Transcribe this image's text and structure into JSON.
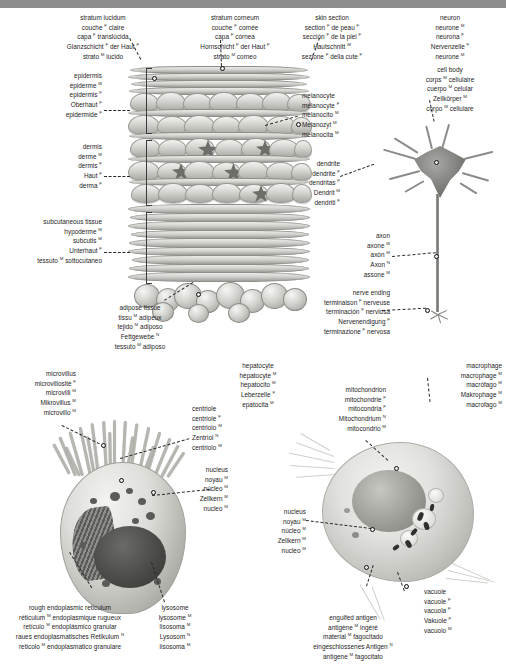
{
  "page": {
    "languages": [
      "English",
      "French",
      "Spanish",
      "German",
      "Italian"
    ],
    "gender_marks": {
      "masculine": "M",
      "feminine": "F",
      "neuter": "N"
    }
  },
  "panels": {
    "skin": {
      "heading_left": {
        "en": "stratum lucidum",
        "fr": "couche",
        "fr_g": "F",
        "fr_rest": "claire",
        "es": "capa",
        "es_g": "F",
        "es_rest": "translúcida",
        "de": "Glanzschicht",
        "de_g": "F",
        "de_rest": "der Haut",
        "de_rest_g": "F",
        "it": "strato",
        "it_g": "M",
        "it_rest": "lucido"
      },
      "heading_mid": {
        "en": "stratum corneum",
        "fr": "couche",
        "fr_g": "F",
        "fr_rest": "cornée",
        "es": "capa",
        "es_g": "F",
        "es_rest": "córnea",
        "de": "Hornschicht",
        "de_g": "F",
        "de_rest": "der Haut",
        "de_rest_g": "F",
        "it": "strato",
        "it_g": "M",
        "it_rest": "corneo"
      },
      "heading_right": {
        "en": "skin section",
        "fr": "section",
        "fr_g": "F",
        "fr_rest": "de peau",
        "fr_rest_g": "F",
        "es": "sección",
        "es_g": "F",
        "es_rest": "de la piel",
        "es_rest_g": "F",
        "de": "Hautschnitt",
        "de_g": "M",
        "it": "sezione",
        "it_g": "F",
        "it_rest": "della cute",
        "it_rest_g": "F"
      },
      "epidermis": {
        "en": "epidermis",
        "fr": "épiderme",
        "fr_g": "M",
        "es": "epidermis",
        "es_g": "F",
        "de": "Oberhaut",
        "de_g": "F",
        "it": "epidermide",
        "it_g": "F"
      },
      "dermis": {
        "en": "dermis",
        "fr": "derme",
        "fr_g": "M",
        "es": "dermis",
        "es_g": "F",
        "de": "Haut",
        "de_g": "F",
        "it": "derma",
        "it_g": "F"
      },
      "subcutaneous": {
        "en": "subcutaneous tissue",
        "fr": "hypoderme",
        "fr_g": "M",
        "es": "subcutis",
        "es_g": "M",
        "de": "Unterhaut",
        "de_g": "F",
        "it": "tessuto",
        "it_g": "M",
        "it_rest": "sottocutaneo"
      },
      "adipose": {
        "en": "adipose tissue",
        "fr": "tissu",
        "fr_g": "M",
        "fr_rest": "adipeux",
        "es": "tejido",
        "es_g": "M",
        "es_rest": "adiposo",
        "de": "Fettgewebe",
        "de_g": "N",
        "it": "tessuto",
        "it_g": "M",
        "it_rest": "adiposo"
      },
      "melanocyte": {
        "en": "melanocyte",
        "fr": "mélanocyte",
        "fr_g": "F",
        "es": "melanocito",
        "es_g": "M",
        "de": "Melanozyt",
        "de_g": "M",
        "it": "melanocita",
        "it_g": "M"
      }
    },
    "neuron": {
      "heading": {
        "en": "neuron",
        "fr": "neurone",
        "fr_g": "M",
        "es": "neurona",
        "es_g": "F",
        "de": "Nervenzelle",
        "de_g": "F",
        "it": "neurone",
        "it_g": "M"
      },
      "cell_body": {
        "en": "cell body",
        "fr": "corps",
        "fr_g": "M",
        "fr_rest": "cellulaire",
        "es": "cuerpo",
        "es_g": "M",
        "es_rest": "celular",
        "de": "Zellkörper",
        "de_g": "M",
        "it": "corpo",
        "it_g": "M",
        "it_rest": "cellulare"
      },
      "dendrite": {
        "en": "dendrite",
        "fr": "dendrite",
        "fr_g": "F",
        "es": "dendritas",
        "es_g": "F",
        "de": "Dendrit",
        "de_g": "M",
        "it": "dendriti",
        "it_g": "F"
      },
      "axon": {
        "en": "axon",
        "fr": "axone",
        "fr_g": "M",
        "es": "axón",
        "es_g": "M",
        "de": "Axon",
        "de_g": "N",
        "it": "assone",
        "it_g": "M"
      },
      "nerve_ending": {
        "en": "nerve ending",
        "fr": "terminaison",
        "fr_g": "F",
        "fr_rest": "nerveuse",
        "es": "terminación",
        "es_g": "F",
        "es_rest": "nerviosa",
        "de": "Nervenendigung",
        "de_g": "F",
        "it": "terminazione",
        "it_g": "F",
        "it_rest": "nervosa"
      }
    },
    "hepatocyte": {
      "heading": {
        "en": "hepatocyte",
        "fr": "hépatocyte",
        "fr_g": "M",
        "es": "hepatocito",
        "es_g": "M",
        "de": "Leberzelle",
        "de_g": "F",
        "it": "epatocita",
        "it_g": "M"
      },
      "microvillus": {
        "en": "microvillus",
        "fr": "microvillosité",
        "fr_g": "F",
        "es": "microvilli",
        "es_g": "M",
        "de": "Mikrovillus",
        "de_g": "M",
        "it": "microvillo",
        "it_g": "M"
      },
      "centriole": {
        "en": "centriole",
        "fr": "centriole",
        "fr_g": "F",
        "es": "centriolo",
        "es_g": "M",
        "de": "Zentriol",
        "de_g": "N",
        "it": "centriolo",
        "it_g": "M"
      },
      "nucleus": {
        "en": "nucleus",
        "fr": "noyau",
        "fr_g": "M",
        "es": "núcleo",
        "es_g": "M",
        "de": "Zellkern",
        "de_g": "M",
        "it": "nucleo",
        "it_g": "M"
      },
      "rough_er": {
        "en": "rough endoplasmic reticulum",
        "fr": "réticulum",
        "fr_g": "M",
        "fr_rest": "endoplasmique rugueux",
        "es": "retículo",
        "es_g": "M",
        "es_rest": "endoplásmico granular",
        "de": "raues endoplasmatisches Retikulum",
        "de_g": "N",
        "it": "reticolo",
        "it_g": "M",
        "it_rest": "endoplasmatico granulare"
      },
      "lysosome": {
        "en": "lysosome",
        "fr": "lysosome",
        "fr_g": "M",
        "es": "lisosoma",
        "es_g": "M",
        "de": "Lysosom",
        "de_g": "N",
        "it": "lisosoma",
        "it_g": "M"
      }
    },
    "macrophage": {
      "heading": {
        "en": "macrophage",
        "fr": "macrophage",
        "fr_g": "M",
        "es": "macrófago",
        "es_g": "M",
        "de": "Makrophage",
        "de_g": "M",
        "it": "macrofago",
        "it_g": "M"
      },
      "mitochondrion": {
        "en": "mitochondrion",
        "fr": "mitochondrie",
        "fr_g": "F",
        "es": "mitocondria",
        "es_g": "F",
        "de": "Mitochondrium",
        "de_g": "N",
        "it": "mitocondrio",
        "it_g": "M"
      },
      "nucleus": {
        "en": "nucleus",
        "fr": "noyau",
        "fr_g": "M",
        "es": "núcleo",
        "es_g": "M",
        "de": "Zellkern",
        "de_g": "M",
        "it": "nucleo",
        "it_g": "M"
      },
      "vacuole": {
        "en": "vacuole",
        "fr": "vacuole",
        "fr_g": "F",
        "es": "vacuola",
        "es_g": "F",
        "de": "Vakuole",
        "de_g": "F",
        "it": "vacuolo",
        "it_g": "M"
      },
      "engulfed_antigen": {
        "en": "engulfed antigen",
        "fr": "antigène",
        "fr_g": "M",
        "fr_rest": "ingéré",
        "es": "material",
        "es_g": "M",
        "es_rest": "fagocitado",
        "de": "eingeschlossenes Antigen",
        "de_g": "N",
        "it": "antigene",
        "it_g": "M",
        "it_rest": "fagocitato"
      }
    }
  },
  "colors": {
    "background": "#ffffff",
    "text": "#1d1d1d",
    "top_strip": "#8d8d8d",
    "artwork_light": "#ececea",
    "artwork_mid": "#a9a9a4",
    "artwork_dark": "#3c3c39"
  }
}
